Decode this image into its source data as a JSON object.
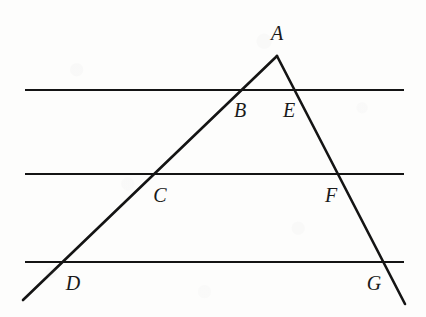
{
  "figure": {
    "background_color": "#fdfdfc",
    "stroke_color": "#141414",
    "label_color": "#1a1a1a"
  },
  "chart_data": {
    "type": "diagram",
    "title": "",
    "xlabel": "",
    "ylabel": "",
    "grid": false,
    "legend": null,
    "canvas": {
      "width": 426,
      "height": 317
    },
    "apex": {
      "label": "A",
      "x": 277,
      "y": 56
    },
    "points": [
      {
        "label": "A",
        "x": 277,
        "y": 56,
        "label_x": 277,
        "label_y": 33,
        "on": "apex"
      },
      {
        "label": "B",
        "x": 237,
        "y": 90,
        "label_x": 240,
        "label_y": 110,
        "on": "line-1 ∩ left-ray"
      },
      {
        "label": "E",
        "x": 298,
        "y": 90,
        "label_x": 289,
        "label_y": 110,
        "on": "line-1 ∩ right-ray"
      },
      {
        "label": "C",
        "x": 153,
        "y": 174,
        "label_x": 160,
        "label_y": 195,
        "on": "line-2 ∩ left-ray"
      },
      {
        "label": "F",
        "x": 340,
        "y": 174,
        "label_x": 331,
        "label_y": 195,
        "on": "line-2 ∩ right-ray"
      },
      {
        "label": "D",
        "x": 62,
        "y": 262,
        "label_x": 73,
        "label_y": 283,
        "on": "line-3 ∩ left-ray"
      },
      {
        "label": "G",
        "x": 388,
        "y": 262,
        "label_x": 374,
        "label_y": 283,
        "on": "line-3 ∩ right-ray"
      }
    ],
    "parallel_lines": [
      {
        "name": "line-1",
        "y": 90,
        "x1": 25,
        "x2": 404,
        "stroke_width": 2.2
      },
      {
        "name": "line-2",
        "y": 174,
        "x1": 25,
        "x2": 404,
        "stroke_width": 2.2
      },
      {
        "name": "line-3",
        "y": 262,
        "x1": 25,
        "x2": 404,
        "stroke_width": 2.2
      }
    ],
    "rays": [
      {
        "name": "left-ray",
        "from": "A",
        "through": [
          "B",
          "C",
          "D"
        ],
        "x1": 277,
        "y1": 56,
        "x2": 23,
        "y2": 300,
        "stroke_width": 2.6
      },
      {
        "name": "right-ray",
        "from": "A",
        "through": [
          "E",
          "F",
          "G"
        ],
        "x1": 277,
        "y1": 56,
        "x2": 405,
        "y2": 304,
        "stroke_width": 2.6
      }
    ],
    "labels": [
      "A",
      "B",
      "E",
      "C",
      "F",
      "D",
      "G"
    ]
  }
}
